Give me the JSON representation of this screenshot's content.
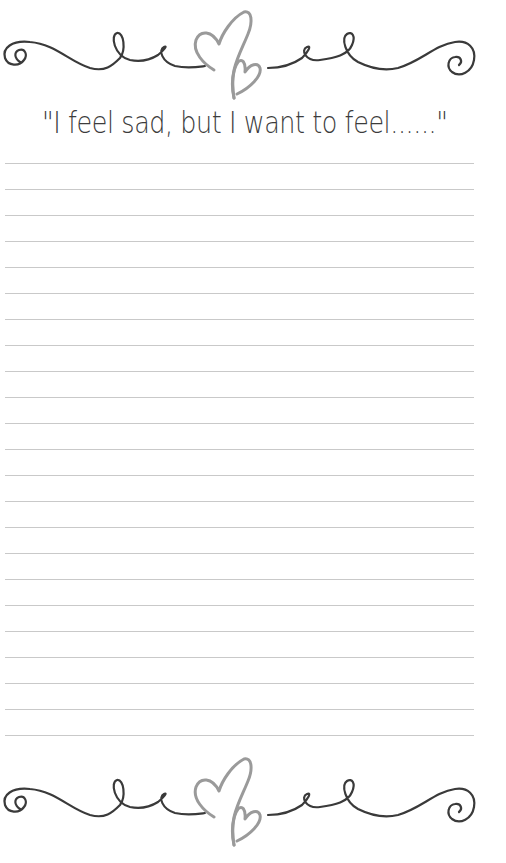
{
  "page": {
    "title": "\"I feel sad, but I want to feel......\"",
    "ruled_line_count": 23,
    "ruled_line_start_y": 163,
    "ruled_line_spacing": 26,
    "colors": {
      "background": "#ffffff",
      "ornament_swirl": "#3a3a3a",
      "ornament_heart": "#9a9a9a",
      "title_text": "#3c3c3c",
      "ruled_line": "#c9c9c9"
    },
    "ornaments": {
      "top": "swirl-heart-divider",
      "bottom": "swirl-heart-divider"
    }
  }
}
